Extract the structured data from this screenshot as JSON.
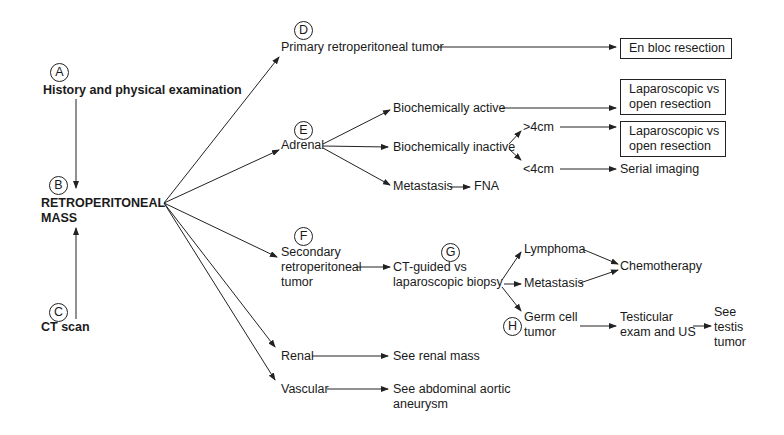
{
  "diagram": {
    "type": "clinical-algorithm-flowchart",
    "markers": [
      "A",
      "B",
      "C",
      "D",
      "E",
      "F",
      "G",
      "H"
    ],
    "nodes": {
      "history": "History and physical examination",
      "mass_l1": "RETROPERITONEAL",
      "mass_l2": "MASS",
      "ct_scan": "CT scan",
      "primary": "Primary retroperitoneal tumor",
      "en_bloc": "En bloc resection",
      "adrenal": "Adrenal",
      "bio_active": "Biochemically active",
      "lap_open_1_l1": "Laparoscopic vs",
      "lap_open_1_l2": "open resection",
      "bio_inactive": "Biochemically inactive",
      "gt4": ">4cm",
      "lap_open_2_l1": "Laparoscopic vs",
      "lap_open_2_l2": "open resection",
      "lt4": "<4cm",
      "serial": "Serial imaging",
      "metastasis_adrenal": "Metastasis",
      "fna": "FNA",
      "secondary_l1": "Secondary",
      "secondary_l2": "retroperitoneal",
      "secondary_l3": "tumor",
      "ctguided_l1": "CT-guided vs",
      "ctguided_l2": "laparoscopic biopsy",
      "lymphoma": "Lymphoma",
      "metastasis_sec": "Metastasis",
      "chemo": "Chemotherapy",
      "germ_l1": "Germ cell",
      "germ_l2": "tumor",
      "testicular_l1": "Testicular",
      "testicular_l2": "exam and US",
      "see_testis_l1": "See",
      "see_testis_l2": "testis",
      "see_testis_l3": "tumor",
      "renal": "Renal",
      "see_renal": "See renal mass",
      "vascular": "Vascular",
      "see_aaa_l1": "See abdominal aortic",
      "see_aaa_l2": "aneurysm"
    }
  }
}
